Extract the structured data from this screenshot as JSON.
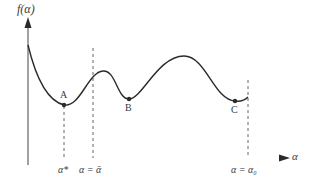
{
  "diagram": {
    "type": "function-plot-local-minima",
    "y_axis_label": "f(α)",
    "x_axis_label": "α",
    "points": [
      {
        "label": "A",
        "description": "global minimum"
      },
      {
        "label": "B",
        "description": "local minimum"
      },
      {
        "label": "C",
        "description": "local minimum"
      }
    ],
    "x_ticks": [
      {
        "label": "α*",
        "position": "at A"
      },
      {
        "label": "α = ᾱ",
        "position": "dashed line before first peak"
      },
      {
        "label": "α = α₀",
        "position": "right end of interval"
      }
    ],
    "colors": {
      "curve": "#2a2a2a",
      "axis_left": "#e0404a",
      "axis_right": "#3aa6b0",
      "text": "#3a3a3a"
    }
  }
}
